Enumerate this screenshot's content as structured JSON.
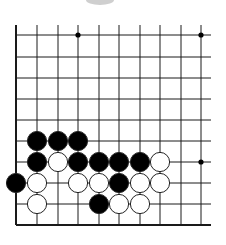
{
  "diagram": {
    "type": "go-board-fragment",
    "columns_x": [
      16,
      37,
      58,
      78,
      99,
      119,
      140,
      160,
      181,
      201
    ],
    "rows_y": [
      35,
      57,
      78,
      99,
      120,
      141,
      162,
      183,
      204,
      225
    ],
    "line_color": "#1a1a1a",
    "edges": [
      "left",
      "bottom"
    ],
    "star_points": [
      {
        "col": 3,
        "row": 0
      },
      {
        "col": 9,
        "row": 0
      },
      {
        "col": 9,
        "row": 6
      }
    ],
    "stones": [
      {
        "color": "black",
        "col": 1,
        "row": 5
      },
      {
        "color": "black",
        "col": 2,
        "row": 5
      },
      {
        "color": "black",
        "col": 3,
        "row": 5
      },
      {
        "color": "black",
        "col": 1,
        "row": 6
      },
      {
        "color": "white",
        "col": 2,
        "row": 6
      },
      {
        "color": "black",
        "col": 3,
        "row": 6
      },
      {
        "color": "black",
        "col": 4,
        "row": 6
      },
      {
        "color": "black",
        "col": 5,
        "row": 6
      },
      {
        "color": "black",
        "col": 6,
        "row": 6
      },
      {
        "color": "white",
        "col": 7,
        "row": 6
      },
      {
        "color": "black",
        "col": 0,
        "row": 7
      },
      {
        "color": "white",
        "col": 1,
        "row": 7
      },
      {
        "color": "white",
        "col": 3,
        "row": 7
      },
      {
        "color": "white",
        "col": 4,
        "row": 7
      },
      {
        "color": "black",
        "col": 5,
        "row": 7
      },
      {
        "color": "white",
        "col": 6,
        "row": 7
      },
      {
        "color": "white",
        "col": 7,
        "row": 7
      },
      {
        "color": "white",
        "col": 1,
        "row": 8
      },
      {
        "color": "black",
        "col": 4,
        "row": 8
      },
      {
        "color": "white",
        "col": 5,
        "row": 8
      },
      {
        "color": "white",
        "col": 6,
        "row": 8
      }
    ],
    "colors": {
      "black_stone": "#000000",
      "white_stone": "#ffffff",
      "stone_outline": "#222222"
    }
  }
}
